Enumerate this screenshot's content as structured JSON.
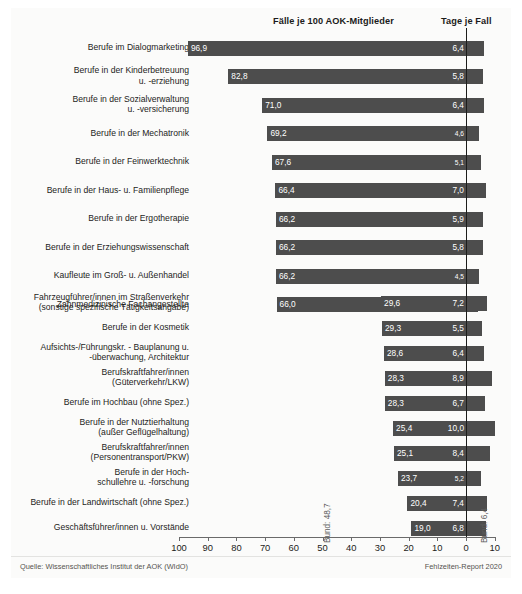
{
  "header": {
    "faelle_title": "Fälle je 100 AOK-Mitglieder",
    "tage_title": "Tage je Fall"
  },
  "footer": {
    "source": "Quelle: Wissenschaftliches Institut der AOK (WIdO)",
    "report": "Fehlzeiten-Report 2020"
  },
  "annotations": {
    "bund_faelle": "Bund: 48,7",
    "bund_tage": "Bund: 6,4"
  },
  "axis": {
    "labels": [
      "100",
      "90",
      "80",
      "70",
      "60",
      "50",
      "40",
      "30",
      "20",
      "10",
      "0",
      "10"
    ],
    "values": [
      100,
      90,
      80,
      70,
      60,
      50,
      40,
      30,
      20,
      10,
      0,
      10
    ]
  },
  "chart_data": {
    "type": "bar",
    "orientation": "horizontal",
    "title": "",
    "subtitle": "",
    "xlabel": "",
    "ylabel": "",
    "grid": false,
    "legend_position": "top",
    "axis_left_label": "Fälle je 100 AOK-Mitglieder",
    "axis_right_label": "Tage je Fall",
    "x_ticks_left": [
      100,
      90,
      80,
      70,
      60,
      50,
      40,
      30,
      20,
      10,
      0
    ],
    "x_ticks_right": [
      0,
      10
    ],
    "reference_lines": {
      "bund_faelle": 48.7,
      "bund_tage": 6.4
    },
    "groups": [
      {
        "name": "Höchste Fallzahlen",
        "categories": [
          "Berufe im Dialogmarketing",
          "Berufe in der Kinderbetreuung\nu. -erziehung",
          "Berufe in der Sozialverwaltung\nu. -versicherung",
          "Berufe in der Mechatronik",
          "Berufe in der Feinwerktechnik",
          "Berufe in der Haus- u. Familienpflege",
          "Berufe in der Ergotherapie",
          "Berufe in der Erziehungswissenschaft",
          "Kaufleute im Groß- u. Außenhandel",
          "Zahnmedizinische Fachangestellte"
        ],
        "faelle": [
          96.9,
          82.8,
          71.0,
          69.2,
          67.6,
          66.4,
          66.2,
          66.2,
          66.2,
          66.0
        ],
        "faelle_labels": [
          "96,9",
          "82,8",
          "71,0",
          "69,2",
          "67,6",
          "66,4",
          "66,2",
          "66,2",
          "66,2",
          "66,0"
        ],
        "tage": [
          6.4,
          5.8,
          6.4,
          4.6,
          5.1,
          7.0,
          5.9,
          5.8,
          4.5,
          4.3
        ],
        "tage_labels": [
          "6,4",
          "5,8",
          "6,4",
          "4,6",
          "5,1",
          "7,0",
          "5,9",
          "5,8",
          "4,5",
          "4,3"
        ]
      },
      {
        "name": "Niedrigste Fallzahlen",
        "categories": [
          "Fahrzeugführer/innen im Straßenverkehr\n(sonstige spezifische Tätigkeitsangabe)",
          "Berufe in der Kosmetik",
          "Aufsichts-/Führungskr. - Bauplanung u.\n-überwachung, Architektur",
          "Berufskraftfahrer/innen\n(Güterverkehr/LKW)",
          "Berufe im Hochbau (ohne Spez.)",
          "Berufe in der Nutztierhaltung\n(außer Geflügelhaltung)",
          "Berufskraftfahrer/innen\n(Personentransport/PKW)",
          "Berufe in der Hoch-\nschullehre u. -forschung",
          "Berufe in der Landwirtschaft (ohne Spez.)",
          "Geschäftsführer/innen u. Vorstände"
        ],
        "faelle": [
          29.6,
          29.3,
          28.6,
          28.3,
          28.3,
          25.4,
          25.1,
          23.7,
          20.4,
          19.0
        ],
        "faelle_labels": [
          "29,6",
          "29,3",
          "28,6",
          "28,3",
          "28,3",
          "25,4",
          "25,1",
          "23,7",
          "20,4",
          "19,0"
        ],
        "tage": [
          7.2,
          5.5,
          6.4,
          8.9,
          6.7,
          10.0,
          8.4,
          5.2,
          7.4,
          6.8
        ],
        "tage_labels": [
          "7,2",
          "5,5",
          "6,4",
          "8,9",
          "6,7",
          "10,0",
          "8,4",
          "5,2",
          "7,4",
          "6,8"
        ]
      }
    ]
  }
}
